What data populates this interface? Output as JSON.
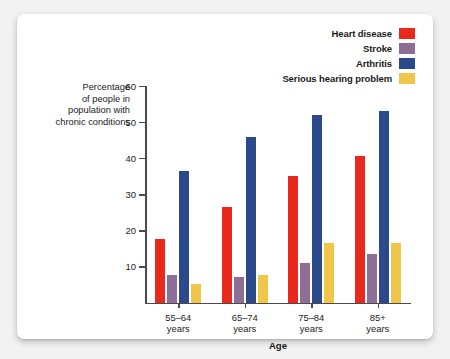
{
  "chart_data": {
    "type": "bar",
    "title": "",
    "xlabel": "Age",
    "ylabel": "Percentage of people in population with chronic conditions",
    "ylabel_lines": [
      "Percentage",
      "of people in",
      "population with",
      "chronic conditions"
    ],
    "categories": [
      "55–64\nyears",
      "65–74\nyears",
      "75–84\nyears",
      "85+\nyears"
    ],
    "category_lines": [
      [
        "55–64",
        "years"
      ],
      [
        "65–74",
        "years"
      ],
      [
        "75–84",
        "years"
      ],
      [
        "85+",
        "years"
      ]
    ],
    "ylim": [
      0,
      60
    ],
    "yticks": [
      10,
      20,
      30,
      40,
      50,
      60
    ],
    "ytick_labels": [
      "10",
      "20",
      "30",
      "40",
      "50",
      "60"
    ],
    "grid": false,
    "legend_position": "top-right",
    "series": [
      {
        "name": "Heart disease",
        "color": "#e8291c",
        "values": [
          17.5,
          26.5,
          35.0,
          40.5
        ]
      },
      {
        "name": "Stroke",
        "color": "#8d6e96",
        "values": [
          7.5,
          7.0,
          11.0,
          13.5
        ]
      },
      {
        "name": "Arthritis",
        "color": "#2a4a8b",
        "values": [
          36.5,
          46.0,
          52.0,
          53.0
        ]
      },
      {
        "name": "Serious hearing problem",
        "color": "#efc54a",
        "values": [
          5.0,
          7.5,
          16.5,
          16.5
        ]
      }
    ]
  }
}
